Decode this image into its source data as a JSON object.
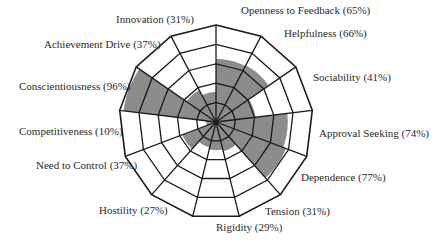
{
  "chart_data": {
    "type": "radar",
    "subtype": "segmented-polar-area",
    "title": "",
    "center": [
      216,
      122
    ],
    "outer_radius": 97,
    "rings": 5,
    "fill_color": "#8c8c8c",
    "grid_color": "#1a1a1a",
    "start_angle_deg": -90,
    "direction": "clockwise",
    "categories": [
      "Openness to Feedback",
      "Helpfulness",
      "Sociability",
      "Approval Seeking",
      "Dependence",
      "Tension",
      "Rigidity",
      "Hostility",
      "Need to Control",
      "Competitiveness",
      "Conscientiousness",
      "Achievement Drive",
      "Innovation"
    ],
    "values": [
      65,
      66,
      41,
      74,
      77,
      31,
      29,
      27,
      37,
      10,
      96,
      37,
      31
    ],
    "ylim": [
      0,
      100
    ]
  },
  "labels": [
    {
      "text": "Openness to Feedback (65%)",
      "x": 241,
      "y": 4
    },
    {
      "text": "Helpfulness (66%)",
      "x": 284,
      "y": 27
    },
    {
      "text": "Sociability (41%)",
      "x": 313,
      "y": 71
    },
    {
      "text": "Approval Seeking (74%)",
      "x": 319,
      "y": 127
    },
    {
      "text": "Dependence (77%)",
      "x": 301,
      "y": 171
    },
    {
      "text": "Tension (31%)",
      "x": 265,
      "y": 205
    },
    {
      "text": "Rigidity (29%)",
      "x": 216,
      "y": 221
    },
    {
      "text": "Hostility (27%)",
      "x": 99,
      "y": 204
    },
    {
      "text": "Need to Control (37%)",
      "x": 36,
      "y": 159
    },
    {
      "text": "Competitiveness (10%)",
      "x": 19,
      "y": 125
    },
    {
      "text": "Conscientiousness (96%)",
      "x": 19,
      "y": 80
    },
    {
      "text": "Achievement Drive (37%)",
      "x": 44,
      "y": 38
    },
    {
      "text": "Innovation (31%)",
      "x": 116,
      "y": 13
    }
  ]
}
